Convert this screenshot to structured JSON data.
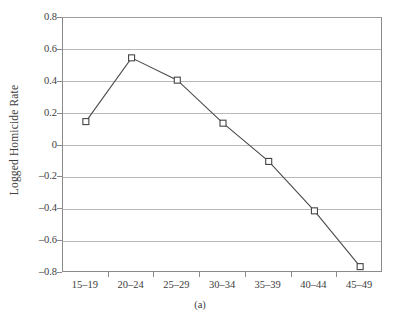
{
  "chart_data": {
    "type": "line",
    "title": "",
    "subtitle": "",
    "caption": "(a)",
    "xlabel": "",
    "ylabel": "Logged Homicide Rate",
    "categories": [
      "15–19",
      "20–24",
      "25–29",
      "30–34",
      "35–39",
      "40–44",
      "45–49"
    ],
    "values": [
      0.15,
      0.55,
      0.41,
      0.14,
      -0.1,
      -0.41,
      -0.76
    ],
    "series": [
      {
        "name": "Logged Homicide Rate",
        "values": [
          0.15,
          0.55,
          0.41,
          0.14,
          -0.1,
          -0.41,
          -0.76
        ]
      }
    ],
    "ylim": [
      -0.8,
      0.8
    ],
    "ytick_values": [
      0.8,
      0.6,
      0.4,
      0.2,
      0,
      -0.2,
      -0.4,
      -0.6,
      -0.8
    ],
    "ytick_labels": [
      "0.8",
      "0.6",
      "0.4",
      "0.2",
      "0",
      "–0.2",
      "–0.4",
      "–0.6",
      "–0.8"
    ],
    "grid": "horizontal",
    "legend": "none",
    "marker": "open-square",
    "colors": {
      "line": "#4a4a4a",
      "marker_fill": "#ffffff",
      "marker_stroke": "#454545",
      "gridline": "#b9b9b9",
      "axis": "#8a8a8a",
      "text": "#3d3d3d",
      "background": "#ffffff"
    }
  }
}
